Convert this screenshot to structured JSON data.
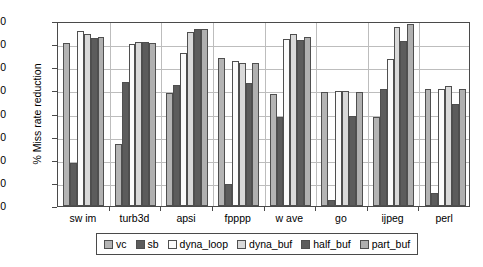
{
  "chart_data": {
    "type": "bar",
    "title": "",
    "xlabel": "",
    "ylabel": "% Miss rate reduction",
    "ylim": [
      0,
      80
    ],
    "ytick_step": 10,
    "yticks": [
      "80",
      "70",
      "60",
      "50",
      "40",
      "30",
      "20",
      "10",
      "0"
    ],
    "grid": true,
    "legend_position": "bottom",
    "categories": [
      "sw im",
      "turb3d",
      "apsi",
      "fpppp",
      "w ave",
      "go",
      "ijpeg",
      "perl"
    ],
    "series": [
      {
        "name": "vc",
        "color": "#b4b4b4",
        "values": [
          70.3,
          26.8,
          48.8,
          63.9,
          48.5,
          49.3,
          38.6,
          50.6
        ]
      },
      {
        "name": "sb",
        "color": "#5c5c5c",
        "values": [
          18.8,
          53.5,
          52.3,
          9.5,
          38.7,
          2.4,
          50.6,
          5.7
        ]
      },
      {
        "name": "dyna_loop",
        "color": "#fbfbfb",
        "values": [
          75.5,
          70.0,
          66.3,
          62.6,
          72.3,
          49.8,
          63.5,
          50.6
        ]
      },
      {
        "name": "dyna_buf",
        "color": "#d9d9d9",
        "values": [
          74.5,
          70.8,
          75.2,
          61.7,
          74.2,
          49.8,
          77.3,
          51.9
        ]
      },
      {
        "name": "half_buf",
        "color": "#5c5c5c",
        "values": [
          72.8,
          71.0,
          76.5,
          53.3,
          71.8,
          39.1,
          71.5,
          44.2
        ]
      },
      {
        "name": "part_buf",
        "color": "#b0b0b0",
        "values": [
          73.0,
          70.5,
          76.5,
          61.7,
          73.1,
          49.3,
          78.6,
          50.6
        ]
      }
    ]
  },
  "legend": {
    "items": [
      {
        "label": "vc"
      },
      {
        "label": "sb"
      },
      {
        "label": "dyna_loop"
      },
      {
        "label": "dyna_buf"
      },
      {
        "label": "half_buf"
      },
      {
        "label": "part_buf"
      }
    ]
  }
}
